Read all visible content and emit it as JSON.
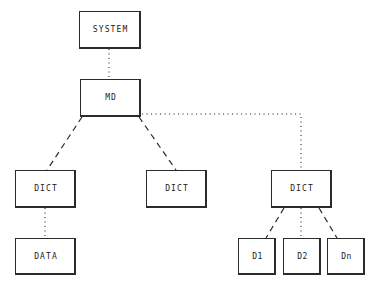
{
  "diagram": {
    "background_color": "#ffffff",
    "line_color": "#2b2b2b",
    "text_color": "#1a1a1a",
    "nodes": [
      {
        "id": "system",
        "label": "SYSTEM",
        "x": 79,
        "y": 11,
        "w": 62,
        "h": 38
      },
      {
        "id": "md",
        "label": "MD",
        "x": 80,
        "y": 79,
        "w": 61,
        "h": 38
      },
      {
        "id": "dict_left",
        "label": "DICT",
        "x": 15,
        "y": 170,
        "w": 61,
        "h": 38
      },
      {
        "id": "dict_mid",
        "label": "DICT",
        "x": 146,
        "y": 170,
        "w": 61,
        "h": 38
      },
      {
        "id": "dict_right",
        "label": "DICT",
        "x": 271,
        "y": 170,
        "w": 61,
        "h": 38
      },
      {
        "id": "data",
        "label": "DATA",
        "x": 15,
        "y": 238,
        "w": 61,
        "h": 37
      },
      {
        "id": "d1",
        "label": "D1",
        "x": 238,
        "y": 238,
        "w": 38,
        "h": 37
      },
      {
        "id": "d2",
        "label": "D2",
        "x": 283,
        "y": 238,
        "w": 38,
        "h": 37
      },
      {
        "id": "dn",
        "label": "Dn",
        "x": 327,
        "y": 238,
        "w": 38,
        "h": 37
      }
    ],
    "edges": [
      {
        "id": "system-md",
        "from": "system",
        "to": "md",
        "style": "dotted",
        "points": "109,49 109,79"
      },
      {
        "id": "md-dict-left",
        "from": "md",
        "to": "dict_left",
        "style": "dashed",
        "points": "82,117 47,170"
      },
      {
        "id": "md-dict-mid",
        "from": "md",
        "to": "dict_mid",
        "style": "dashed",
        "points": "139,117 176,170"
      },
      {
        "id": "md-dict-right",
        "from": "md",
        "to": "dict_right",
        "style": "dotted",
        "points": "142,114 301,114 301,170"
      },
      {
        "id": "dict-left-data",
        "from": "dict_left",
        "to": "data",
        "style": "dotted",
        "points": "45,208 45,238"
      },
      {
        "id": "dict-right-d1",
        "from": "dict_right",
        "to": "d1",
        "style": "dashed",
        "points": "284,208 266,238"
      },
      {
        "id": "dict-right-d2",
        "from": "dict_right",
        "to": "d2",
        "style": "dotted",
        "points": "301,208 301,238"
      },
      {
        "id": "dict-right-dn",
        "from": "dict_right",
        "to": "dn",
        "style": "dashed",
        "points": "319,208 337,238"
      }
    ]
  }
}
